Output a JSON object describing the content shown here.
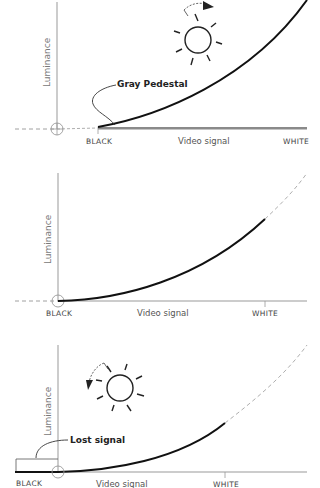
{
  "panels": [
    {
      "id": "pedestal-raised",
      "y_axis_label": "Luminance",
      "x_axis_label": "Video signal",
      "x_left_label": "BLACK",
      "x_right_label": "WHITE",
      "annotation": "Gray Pedestal",
      "sun_rotation": "clockwise"
    },
    {
      "id": "pedestal-correct",
      "y_axis_label": "Luminance",
      "x_axis_label": "Video signal",
      "x_left_label": "BLACK",
      "x_right_label": "WHITE"
    },
    {
      "id": "pedestal-lowered",
      "y_axis_label": "Luminance",
      "x_axis_label": "Video signal",
      "x_left_label": "BLACK",
      "x_right_label": "WHITE",
      "annotation": "Lost signal",
      "sun_rotation": "counterclockwise"
    }
  ],
  "colors": {
    "curve": "#111111",
    "axis": "#999999",
    "pedestal": "#888888",
    "text": "#444444"
  }
}
